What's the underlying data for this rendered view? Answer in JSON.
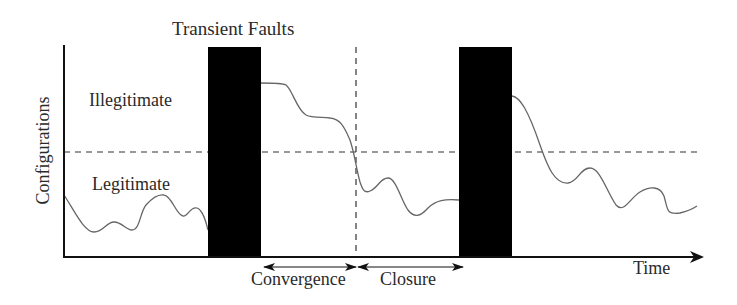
{
  "diagram": {
    "title": "Transient Faults",
    "y_axis_label": "Configurations",
    "x_axis_label": "Time",
    "regions": {
      "upper": "Illegitimate",
      "lower": "Legitimate"
    },
    "phases": [
      {
        "label": "Convergence"
      },
      {
        "label": "Closure"
      }
    ],
    "elements": {
      "fault_bars": 2,
      "threshold_line": "dashed horizontal separating legitimate and illegitimate configurations",
      "phase_marker": "dashed vertical line at the end of convergence"
    },
    "colors": {
      "bar": "#000000",
      "curve": "#666666",
      "axis": "#111111",
      "dashed": "#333333"
    }
  }
}
